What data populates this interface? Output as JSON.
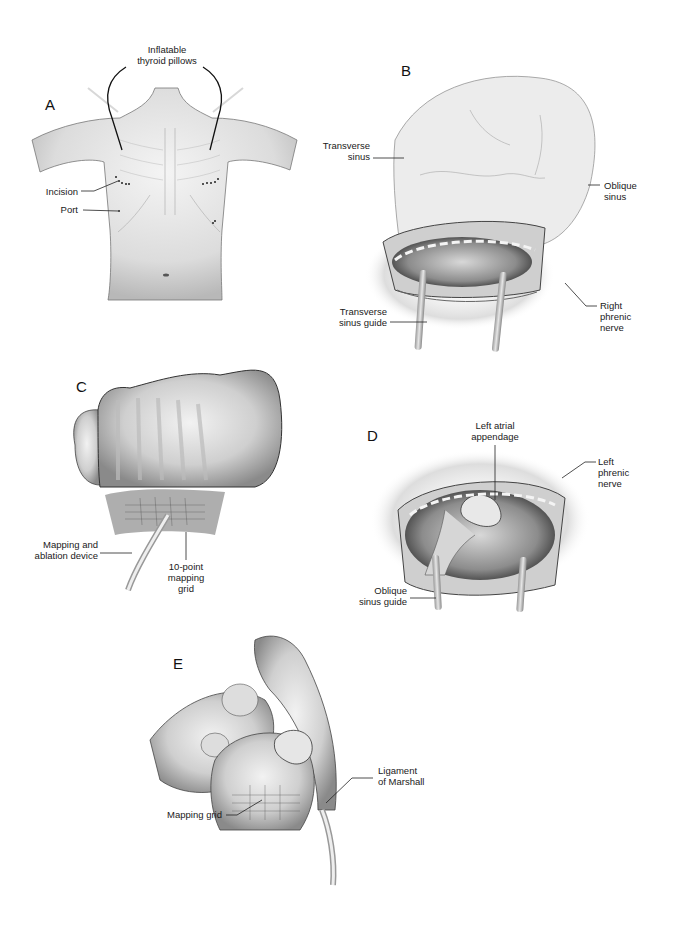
{
  "figure": {
    "panels": [
      {
        "id": "A",
        "letter": "A",
        "labels": {
          "pillows": "Inflatable\nthyroid pillows",
          "incision": "Incision",
          "port": "Port"
        }
      },
      {
        "id": "B",
        "letter": "B",
        "labels": {
          "transverse_sinus": "Transverse\nsinus",
          "oblique_sinus": "Oblique\nsinus",
          "transverse_sinus_guide": "Transverse\nsinus guide",
          "right_phrenic_nerve": "Right\nphrenic\nnerve"
        }
      },
      {
        "id": "C",
        "letter": "C",
        "labels": {
          "device": "Mapping and\nablation device",
          "grid": "10-point\nmapping\ngrid"
        }
      },
      {
        "id": "D",
        "letter": "D",
        "labels": {
          "appendage": "Left atrial\nappendage",
          "left_phrenic_nerve": "Left\nphrenic\nnerve",
          "oblique_sinus_guide": "Oblique\nsinus guide"
        }
      },
      {
        "id": "E",
        "letter": "E",
        "labels": {
          "ligament": "Ligament\nof Marshall",
          "mapping_grid": "Mapping grid"
        }
      }
    ]
  }
}
